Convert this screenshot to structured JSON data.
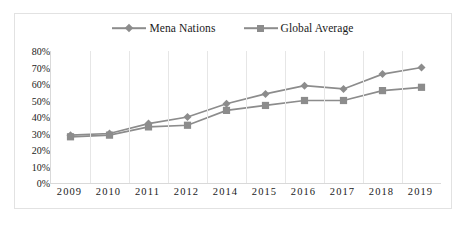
{
  "chart_data": {
    "type": "line",
    "title": "",
    "subtitle": "",
    "xlabel": "",
    "ylabel": "",
    "categories": [
      "2009",
      "2010",
      "2011",
      "2012",
      "2014",
      "2015",
      "2016",
      "2017",
      "2018",
      "2019"
    ],
    "series": [
      {
        "name": "Mena Nations",
        "marker": "diamond",
        "color": "#8c8c8c",
        "values": [
          29,
          30,
          36,
          40,
          48,
          54,
          59,
          57,
          66,
          70
        ]
      },
      {
        "name": "Global Average",
        "marker": "square",
        "color": "#8c8c8c",
        "values": [
          28,
          29,
          34,
          35,
          44,
          47,
          50,
          50,
          56,
          58
        ]
      }
    ],
    "ylim": [
      0,
      80
    ],
    "ytick_values": [
      0,
      10,
      20,
      30,
      40,
      50,
      60,
      70,
      80
    ],
    "ytick_labels": [
      "0%",
      "10%",
      "20%",
      "30%",
      "40%",
      "50%",
      "60%",
      "70%",
      "80%"
    ],
    "grid": "vertical",
    "legend_position": "top-center",
    "legend_entries": [
      "Mena Nations",
      "Global Average"
    ],
    "annotations": [],
    "frame_border_color": "#e2e2e2",
    "gridline_color": "#e6e6e6",
    "axis_color": "#d9d9d9",
    "background_color": "#ffffff",
    "text_color": "#1a1a1a"
  }
}
